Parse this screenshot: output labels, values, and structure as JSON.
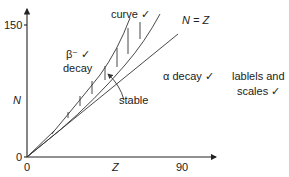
{
  "diagram": {
    "type": "N-Z stability plot",
    "axes": {
      "y_label": "N",
      "x_label": "Z",
      "y_tick_top": "150",
      "origin_y": "0",
      "origin_x": "0",
      "x_tick_right": "90"
    },
    "labels": {
      "curve": "curve ✓",
      "beta_line1": "β⁻ ✓",
      "beta_line2": "decay",
      "n_equals_z": "N = Z",
      "alpha_decay": "α decay ✓",
      "stable": "stable",
      "labels_scales_line1": "lablels and",
      "labels_scales_line2": "scales ✓"
    }
  }
}
